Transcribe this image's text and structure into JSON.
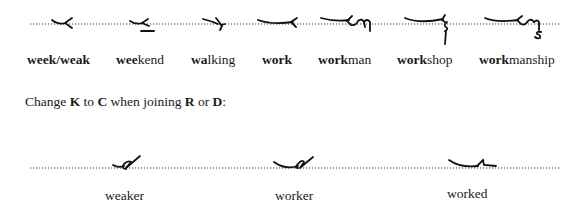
{
  "row1": {
    "words": [
      {
        "bold": "week/weak",
        "rest": "",
        "x": 27
      },
      {
        "bold": "wee",
        "rest": "kend",
        "x": 116
      },
      {
        "bold": "wa",
        "rest": "lking",
        "x": 191
      },
      {
        "bold": "work",
        "rest": "",
        "x": 262
      },
      {
        "bold": "work",
        "rest": "man",
        "x": 318
      },
      {
        "bold": "work",
        "rest": "shop",
        "x": 397
      },
      {
        "bold": "work",
        "rest": "manship",
        "x": 479
      }
    ]
  },
  "instruction": {
    "prefix": "Change ",
    "k": "K",
    "mid1": " to ",
    "c": "C",
    "mid2": " when joining ",
    "r": "R",
    "mid3": " or ",
    "d": "D",
    "suffix": ":"
  },
  "row2": {
    "words": [
      {
        "label": "weaker",
        "x": 105
      },
      {
        "label": "worker",
        "x": 275
      },
      {
        "label": "worked",
        "x": 447
      }
    ]
  },
  "colors": {
    "ink": "#1a1a1a",
    "dots": "#333333"
  }
}
